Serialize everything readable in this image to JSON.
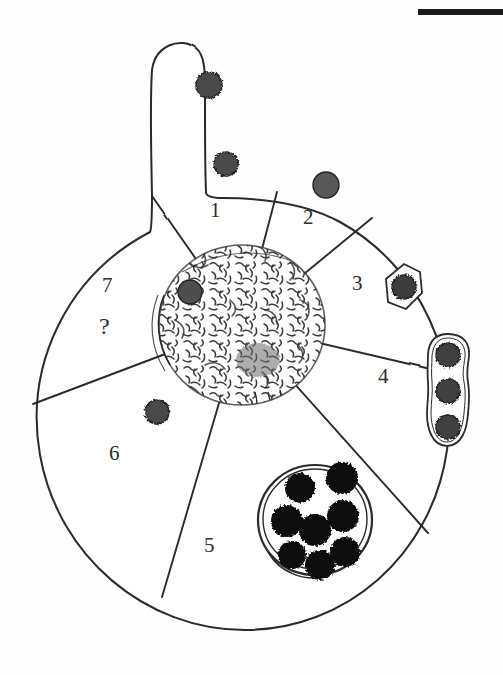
{
  "figure": {
    "caption": "",
    "background_color": "#fefefe",
    "ink_color": "#2b2b2b",
    "particle_fill": "#4a4a4a",
    "dark_particle_fill": "#111111",
    "nucleolus_fill": "#555555",
    "width": 503,
    "height": 675
  },
  "scale_bar": {
    "name": "scale-bar",
    "label": "",
    "color": "#1a1a1a",
    "x": 418,
    "y": 9,
    "length": 85,
    "thickness": 6
  },
  "cell": {
    "name": "phagocytic-cell",
    "body_center_x": 245,
    "body_center_y": 410,
    "body_radius_x": 213,
    "body_radius_y": 213,
    "pseudopod": {
      "name": "pseudopod",
      "description": "finger-like projection at top left"
    },
    "nucleus": {
      "name": "nucleus",
      "center_x": 242,
      "center_y": 325,
      "radius_x": 83,
      "radius_y": 80,
      "texture": "stippled-chromatin"
    }
  },
  "sectors": [
    {
      "id": "1",
      "label": "1",
      "x": 210,
      "y": 200,
      "description": "particle attachment to cell surface"
    },
    {
      "id": "2",
      "label": "2",
      "x": 303,
      "y": 207,
      "description": "particle bound at membrane"
    },
    {
      "id": "3",
      "label": "3",
      "x": 352,
      "y": 273,
      "description": "particle enclosed in forming phagosome"
    },
    {
      "id": "4",
      "label": "4",
      "x": 378,
      "y": 366,
      "description": "multiple particles in elongated vacuole"
    },
    {
      "id": "5",
      "label": "5",
      "x": 204,
      "y": 535,
      "description": "large phagosome containing many digested particles"
    },
    {
      "id": "6",
      "label": "6",
      "x": 109,
      "y": 443,
      "description": "particle released into cytoplasm"
    },
    {
      "id": "7",
      "label": "7",
      "x": 102,
      "y": 275,
      "description": "unknown / unresolved stage"
    }
  ],
  "unknown_marker": {
    "name": "unknown-stage-marker",
    "label": "?",
    "x": 99,
    "y": 314
  },
  "particles": [
    {
      "name": "particle-free-upper",
      "cx": 209,
      "cy": 85,
      "r": 13,
      "style": "rough",
      "fill": "#4a4a4a"
    },
    {
      "name": "particle-attached-pseudopod",
      "cx": 226,
      "cy": 164,
      "r": 12,
      "style": "rough",
      "fill": "#4a4a4a"
    },
    {
      "name": "particle-attached-membrane",
      "cx": 326,
      "cy": 185,
      "r": 13,
      "style": "smooth",
      "fill": "#585858"
    },
    {
      "name": "particle-in-phagosome",
      "cx": 404,
      "cy": 287,
      "r": 12,
      "style": "rough",
      "fill": "#3c3c3c"
    },
    {
      "name": "particle-chain-top",
      "cx": 448,
      "cy": 355,
      "r": 12,
      "style": "rough",
      "fill": "#3f3f3f"
    },
    {
      "name": "particle-chain-middle",
      "cx": 448,
      "cy": 391,
      "r": 12,
      "style": "rough",
      "fill": "#3f3f3f"
    },
    {
      "name": "particle-chain-bottom",
      "cx": 448,
      "cy": 427,
      "r": 12,
      "style": "rough",
      "fill": "#3f3f3f"
    },
    {
      "name": "particle-in-nucleus-region",
      "cx": 190,
      "cy": 292,
      "r": 12,
      "style": "smooth",
      "fill": "#4e4e4e"
    },
    {
      "name": "particle-cytoplasm-sector6",
      "cx": 157,
      "cy": 412,
      "r": 12,
      "style": "rough",
      "fill": "#4a4a4a"
    }
  ],
  "large_phagosome": {
    "name": "large-phagosome",
    "cx": 315,
    "cy": 520,
    "rx": 57,
    "ry": 55,
    "particle_count": 8,
    "particles": [
      {
        "cx": 300,
        "cy": 488,
        "r": 15
      },
      {
        "cx": 342,
        "cy": 478,
        "r": 16
      },
      {
        "cx": 287,
        "cy": 521,
        "r": 16
      },
      {
        "cx": 343,
        "cy": 516,
        "r": 16
      },
      {
        "cx": 315,
        "cy": 530,
        "r": 16
      },
      {
        "cx": 292,
        "cy": 555,
        "r": 14
      },
      {
        "cx": 345,
        "cy": 552,
        "r": 15
      },
      {
        "cx": 320,
        "cy": 565,
        "r": 15
      }
    ]
  }
}
